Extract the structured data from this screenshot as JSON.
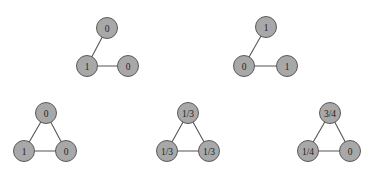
{
  "colors": {
    "node_fill": "#a8a8a8",
    "node_stroke": "#5a5a5a",
    "edge": "#555555",
    "label": "#222222",
    "background": "#ffffff"
  },
  "graphs": [
    {
      "id": "graph-1",
      "nodes": [
        {
          "label": "0",
          "x": 107,
          "y": 28
        },
        {
          "label": "1",
          "x": 87,
          "y": 66
        },
        {
          "label": "0",
          "x": 128,
          "y": 66
        }
      ],
      "edges": [
        [
          0,
          1
        ],
        [
          1,
          2
        ]
      ]
    },
    {
      "id": "graph-2",
      "nodes": [
        {
          "label": "1",
          "x": 266,
          "y": 27
        },
        {
          "label": "0",
          "x": 244,
          "y": 66
        },
        {
          "label": "1",
          "x": 287,
          "y": 66
        }
      ],
      "edges": [
        [
          0,
          1
        ],
        [
          1,
          2
        ]
      ]
    },
    {
      "id": "graph-3",
      "nodes": [
        {
          "label": "0",
          "x": 46,
          "y": 113
        },
        {
          "label": "1",
          "x": 24,
          "y": 151
        },
        {
          "label": "0",
          "x": 66,
          "y": 151
        }
      ],
      "edges": [
        [
          0,
          1
        ],
        [
          1,
          2
        ],
        [
          0,
          2
        ]
      ]
    },
    {
      "id": "graph-4",
      "nodes": [
        {
          "label": "1/3",
          "x": 188,
          "y": 113
        },
        {
          "label": "1/3",
          "x": 167,
          "y": 151
        },
        {
          "label": "1/3",
          "x": 209,
          "y": 151
        }
      ],
      "edges": [
        [
          0,
          1
        ],
        [
          1,
          2
        ],
        [
          0,
          2
        ]
      ]
    },
    {
      "id": "graph-5",
      "nodes": [
        {
          "label": "3/4",
          "x": 330,
          "y": 113
        },
        {
          "label": "1/4",
          "x": 308,
          "y": 151
        },
        {
          "label": "0",
          "x": 350,
          "y": 151
        }
      ],
      "edges": [
        [
          0,
          1
        ],
        [
          1,
          2
        ],
        [
          0,
          2
        ]
      ]
    }
  ]
}
